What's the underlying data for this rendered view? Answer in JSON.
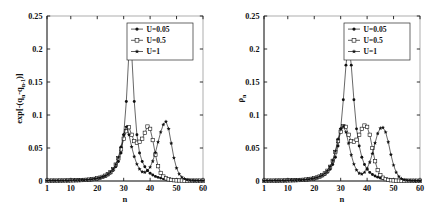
{
  "figure": {
    "background": "#ffffff",
    "panel_count": 2
  },
  "chart_data": [
    {
      "type": "line",
      "panel": "left",
      "title": "",
      "xlabel": "n",
      "ylabel": "exp[-(qₙ-qₙ₋₁)]",
      "ylabel_plain": "exp[-(q_n - q_{n-1})]",
      "xlim": [
        1,
        60
      ],
      "ylim": [
        0,
        0.25
      ],
      "xticks": [
        1,
        10,
        20,
        30,
        40,
        50,
        60
      ],
      "xticklabels": [
        "1",
        "10",
        "20",
        "30",
        "40",
        "50",
        "60"
      ],
      "yticks": [
        0,
        0.05,
        0.1,
        0.15,
        0.2,
        0.25
      ],
      "yticklabels": [
        "0",
        "0.05",
        "0.1",
        "0.15",
        "0.2",
        "0.25"
      ],
      "grid": false,
      "legend_position": "upper right",
      "series": [
        {
          "name": "U=0.05",
          "marker": "filled-circle",
          "x": [
            1,
            2,
            3,
            4,
            5,
            6,
            7,
            8,
            9,
            10,
            11,
            12,
            13,
            14,
            15,
            16,
            17,
            18,
            19,
            20,
            21,
            22,
            23,
            24,
            25,
            26,
            27,
            28,
            29,
            30,
            31,
            32,
            33,
            34,
            35,
            36,
            37,
            38,
            39,
            40,
            41,
            42,
            43,
            44,
            45,
            46,
            47,
            48,
            49,
            50,
            51,
            52,
            53,
            54,
            55,
            56,
            57,
            58,
            59,
            60
          ],
          "y": [
            0.0005,
            0.0005,
            0.0005,
            0.0006,
            0.0006,
            0.0006,
            0.0007,
            0.0007,
            0.0008,
            0.0008,
            0.0009,
            0.001,
            0.0011,
            0.0012,
            0.0014,
            0.0016,
            0.0019,
            0.0023,
            0.0028,
            0.0035,
            0.0044,
            0.0055,
            0.007,
            0.009,
            0.0118,
            0.0158,
            0.0215,
            0.0295,
            0.0425,
            0.07,
            0.1205,
            0.196,
            0.1955,
            0.1205,
            0.07,
            0.0425,
            0.0295,
            0.0215,
            0.0158,
            0.0118,
            0.009,
            0.007,
            0.0055,
            0.0044,
            0.0035,
            0.0028,
            0.0023,
            0.0019,
            0.0016,
            0.0014,
            0.0012,
            0.0011,
            0.001,
            0.0009,
            0.0008,
            0.0008,
            0.0007,
            0.0007,
            0.0006,
            0.0006
          ]
        },
        {
          "name": "U=0.5",
          "marker": "open-square",
          "x": [
            1,
            2,
            3,
            4,
            5,
            6,
            7,
            8,
            9,
            10,
            11,
            12,
            13,
            14,
            15,
            16,
            17,
            18,
            19,
            20,
            21,
            22,
            23,
            24,
            25,
            26,
            27,
            28,
            29,
            30,
            31,
            32,
            33,
            34,
            35,
            36,
            37,
            38,
            39,
            40,
            41,
            42,
            43,
            44,
            45,
            46,
            47,
            48,
            49,
            50,
            51,
            52,
            53,
            54,
            55,
            56,
            57,
            58,
            59,
            60
          ],
          "y": [
            0.0005,
            0.0005,
            0.0006,
            0.0006,
            0.0006,
            0.0007,
            0.0007,
            0.0008,
            0.0008,
            0.0009,
            0.001,
            0.0011,
            0.0012,
            0.0014,
            0.0016,
            0.0018,
            0.0021,
            0.0026,
            0.0032,
            0.004,
            0.005,
            0.0063,
            0.008,
            0.0103,
            0.0135,
            0.0182,
            0.0248,
            0.0345,
            0.048,
            0.064,
            0.0755,
            0.0815,
            0.07,
            0.0605,
            0.058,
            0.0595,
            0.064,
            0.073,
            0.0825,
            0.079,
            0.062,
            0.04,
            0.0225,
            0.0122,
            0.0068,
            0.004,
            0.0025,
            0.0017,
            0.0012,
            0.0009,
            0.0008,
            0.0007,
            0.0006,
            0.0006,
            0.0005,
            0.0005,
            0.0005,
            0.0005,
            0.0005,
            0.0005
          ]
        },
        {
          "name": "U=1",
          "marker": "filled-star",
          "x": [
            1,
            2,
            3,
            4,
            5,
            6,
            7,
            8,
            9,
            10,
            11,
            12,
            13,
            14,
            15,
            16,
            17,
            18,
            19,
            20,
            21,
            22,
            23,
            24,
            25,
            26,
            27,
            28,
            29,
            30,
            31,
            32,
            33,
            34,
            35,
            36,
            37,
            38,
            39,
            40,
            41,
            42,
            43,
            44,
            45,
            46,
            47,
            48,
            49,
            50,
            51,
            52,
            53,
            54,
            55,
            56,
            57,
            58,
            59,
            60
          ],
          "y": [
            0.0005,
            0.0005,
            0.0006,
            0.0006,
            0.0006,
            0.0007,
            0.0007,
            0.0008,
            0.0008,
            0.0009,
            0.001,
            0.0011,
            0.0012,
            0.0014,
            0.0016,
            0.0018,
            0.0021,
            0.0026,
            0.0032,
            0.004,
            0.005,
            0.0063,
            0.008,
            0.0103,
            0.0135,
            0.0182,
            0.025,
            0.0355,
            0.052,
            0.07,
            0.082,
            0.07,
            0.052,
            0.037,
            0.0255,
            0.018,
            0.014,
            0.0132,
            0.0155,
            0.021,
            0.03,
            0.043,
            0.059,
            0.074,
            0.0855,
            0.09,
            0.079,
            0.057,
            0.035,
            0.0195,
            0.0105,
            0.0058,
            0.0032,
            0.0018,
            0.0011,
            0.0008,
            0.0006,
            0.0005,
            0.0005,
            0.0005
          ]
        }
      ]
    },
    {
      "type": "line",
      "panel": "right",
      "title": "",
      "xlabel": "n",
      "ylabel": "ρₙ",
      "ylabel_plain": "rho_n",
      "xlim": [
        1,
        60
      ],
      "ylim": [
        0,
        0.25
      ],
      "xticks": [
        1,
        10,
        20,
        30,
        40,
        50,
        60
      ],
      "xticklabels": [
        "1",
        "10",
        "20",
        "30",
        "40",
        "50",
        "60"
      ],
      "yticks": [
        0,
        0.05,
        0.1,
        0.15,
        0.2,
        0.25
      ],
      "yticklabels": [
        "0",
        "0.05",
        "0.1",
        "0.15",
        "0.2",
        "0.25"
      ],
      "grid": false,
      "legend_position": "upper right",
      "series": [
        {
          "name": "U=0.05",
          "marker": "filled-circle",
          "x": [
            1,
            2,
            3,
            4,
            5,
            6,
            7,
            8,
            9,
            10,
            11,
            12,
            13,
            14,
            15,
            16,
            17,
            18,
            19,
            20,
            21,
            22,
            23,
            24,
            25,
            26,
            27,
            28,
            29,
            30,
            31,
            32,
            33,
            34,
            35,
            36,
            37,
            38,
            39,
            40,
            41,
            42,
            43,
            44,
            45,
            46,
            47,
            48,
            49,
            50,
            51,
            52,
            53,
            54,
            55,
            56,
            57,
            58,
            59,
            60
          ],
          "y": [
            0.0004,
            0.0004,
            0.0005,
            0.0005,
            0.0005,
            0.0006,
            0.0006,
            0.0007,
            0.0007,
            0.0008,
            0.0009,
            0.001,
            0.0011,
            0.0012,
            0.0014,
            0.0016,
            0.0019,
            0.0023,
            0.0029,
            0.0036,
            0.0046,
            0.0058,
            0.0075,
            0.0098,
            0.013,
            0.0178,
            0.025,
            0.036,
            0.053,
            0.079,
            0.123,
            0.1755,
            0.211,
            0.1755,
            0.123,
            0.079,
            0.053,
            0.036,
            0.025,
            0.0178,
            0.013,
            0.0098,
            0.0075,
            0.0058,
            0.0046,
            0.0036,
            0.0029,
            0.0023,
            0.0019,
            0.0016,
            0.0014,
            0.0012,
            0.0011,
            0.001,
            0.0009,
            0.0008,
            0.0007,
            0.0007,
            0.0006,
            0.0006
          ]
        },
        {
          "name": "U=0.5",
          "marker": "open-square",
          "x": [
            1,
            2,
            3,
            4,
            5,
            6,
            7,
            8,
            9,
            10,
            11,
            12,
            13,
            14,
            15,
            16,
            17,
            18,
            19,
            20,
            21,
            22,
            23,
            24,
            25,
            26,
            27,
            28,
            29,
            30,
            31,
            32,
            33,
            34,
            35,
            36,
            37,
            38,
            39,
            40,
            41,
            42,
            43,
            44,
            45,
            46,
            47,
            48,
            49,
            50,
            51,
            52,
            53,
            54,
            55,
            56,
            57,
            58,
            59,
            60
          ],
          "y": [
            0.0004,
            0.0005,
            0.0005,
            0.0005,
            0.0006,
            0.0006,
            0.0007,
            0.0007,
            0.0008,
            0.0009,
            0.001,
            0.0011,
            0.0012,
            0.0014,
            0.0016,
            0.0018,
            0.0022,
            0.0027,
            0.0033,
            0.0042,
            0.0053,
            0.0068,
            0.0088,
            0.0115,
            0.0155,
            0.0215,
            0.0305,
            0.044,
            0.0605,
            0.0745,
            0.083,
            0.082,
            0.07,
            0.0605,
            0.0595,
            0.0625,
            0.07,
            0.079,
            0.084,
            0.082,
            0.07,
            0.05,
            0.03,
            0.0165,
            0.009,
            0.005,
            0.0028,
            0.0017,
            0.0011,
            0.0008,
            0.0006,
            0.0005,
            0.0005,
            0.0004,
            0.0004,
            0.0004,
            0.0004,
            0.0004,
            0.0004,
            0.0004
          ]
        },
        {
          "name": "U=1",
          "marker": "filled-star",
          "x": [
            1,
            2,
            3,
            4,
            5,
            6,
            7,
            8,
            9,
            10,
            11,
            12,
            13,
            14,
            15,
            16,
            17,
            18,
            19,
            20,
            21,
            22,
            23,
            24,
            25,
            26,
            27,
            28,
            29,
            30,
            31,
            32,
            33,
            34,
            35,
            36,
            37,
            38,
            39,
            40,
            41,
            42,
            43,
            44,
            45,
            46,
            47,
            48,
            49,
            50,
            51,
            52,
            53,
            54,
            55,
            56,
            57,
            58,
            59,
            60
          ],
          "y": [
            0.0004,
            0.0005,
            0.0005,
            0.0005,
            0.0006,
            0.0006,
            0.0007,
            0.0007,
            0.0008,
            0.0009,
            0.001,
            0.0011,
            0.0012,
            0.0014,
            0.0016,
            0.0018,
            0.0022,
            0.0027,
            0.0033,
            0.0042,
            0.0053,
            0.0068,
            0.0088,
            0.0115,
            0.0155,
            0.0218,
            0.031,
            0.045,
            0.0635,
            0.079,
            0.083,
            0.074,
            0.057,
            0.0395,
            0.0255,
            0.0165,
            0.0118,
            0.0105,
            0.013,
            0.019,
            0.0285,
            0.0415,
            0.0575,
            0.072,
            0.08,
            0.081,
            0.074,
            0.059,
            0.04,
            0.024,
            0.013,
            0.0068,
            0.0035,
            0.0018,
            0.001,
            0.0006,
            0.0005,
            0.0004,
            0.0004,
            0.0004
          ]
        }
      ]
    }
  ],
  "legend": {
    "entries": [
      {
        "label": "U=0.05",
        "marker": "filled-circle"
      },
      {
        "label": "U=0.5",
        "marker": "open-square"
      },
      {
        "label": "U=1",
        "marker": "filled-star"
      }
    ]
  },
  "left_panel": {
    "ylabel": "exp[-(q",
    "ylabel_sub1": "n",
    "ylabel_mid": "-q",
    "ylabel_sub2": "n-1",
    "ylabel_end": ")]",
    "xlabel": "n"
  },
  "right_panel": {
    "ylabel_rho": "ρ",
    "ylabel_sub": "n",
    "xlabel": "n"
  }
}
